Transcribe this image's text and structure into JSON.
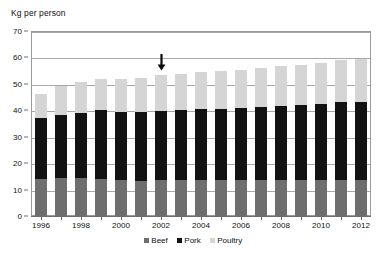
{
  "chart_data": {
    "type": "bar",
    "subtype": "stacked-column",
    "title": "",
    "ylabel": "Kg per person",
    "xlabel": "",
    "ylim": [
      0,
      70
    ],
    "ytick_step": 10,
    "yticks": [
      0,
      10,
      20,
      30,
      40,
      50,
      60,
      70
    ],
    "grid": true,
    "legend_position": "bottom",
    "categories": [
      "1996",
      "1997",
      "1998",
      "1999",
      "2000",
      "2001",
      "2002",
      "2003",
      "2004",
      "2005",
      "2006",
      "2007",
      "2008",
      "2009",
      "2010",
      "2011",
      "2012"
    ],
    "xtick_labels_shown": [
      "1996",
      "1998",
      "2000",
      "2002",
      "2004",
      "2006",
      "2008",
      "2010",
      "2012"
    ],
    "series": [
      {
        "name": "Beef",
        "color": "#6e6e6e",
        "values": [
          14.0,
          14.2,
          14.2,
          14.0,
          13.6,
          13.4,
          13.5,
          13.5,
          13.6,
          13.6,
          13.6,
          13.6,
          13.7,
          13.6,
          13.8,
          13.8,
          13.8
        ]
      },
      {
        "name": "Pork",
        "color": "#121212",
        "values": [
          23.0,
          24.0,
          24.8,
          26.0,
          25.8,
          25.8,
          26.3,
          26.6,
          26.8,
          27.0,
          27.2,
          27.6,
          28.0,
          28.4,
          28.6,
          29.2,
          29.4
        ]
      },
      {
        "name": "Poultry",
        "color": "#d5d5d5",
        "values": [
          9.2,
          11.0,
          11.8,
          12.0,
          12.4,
          13.0,
          13.6,
          13.8,
          14.0,
          14.4,
          14.6,
          14.8,
          15.0,
          15.2,
          15.6,
          16.0,
          16.4
        ]
      }
    ],
    "totals": [
      46.2,
      49.2,
      50.8,
      52.0,
      51.8,
      52.2,
      53.4,
      53.9,
      54.4,
      55.0,
      55.4,
      56.0,
      56.7,
      57.2,
      58.0,
      59.0,
      59.6
    ],
    "annotations": [
      {
        "name": "down-arrow",
        "category": "2002",
        "value": 60,
        "symbol": "↓"
      }
    ]
  },
  "legend": {
    "items": [
      {
        "label": "Beef"
      },
      {
        "label": "Pork"
      },
      {
        "label": "Poultry"
      }
    ]
  }
}
